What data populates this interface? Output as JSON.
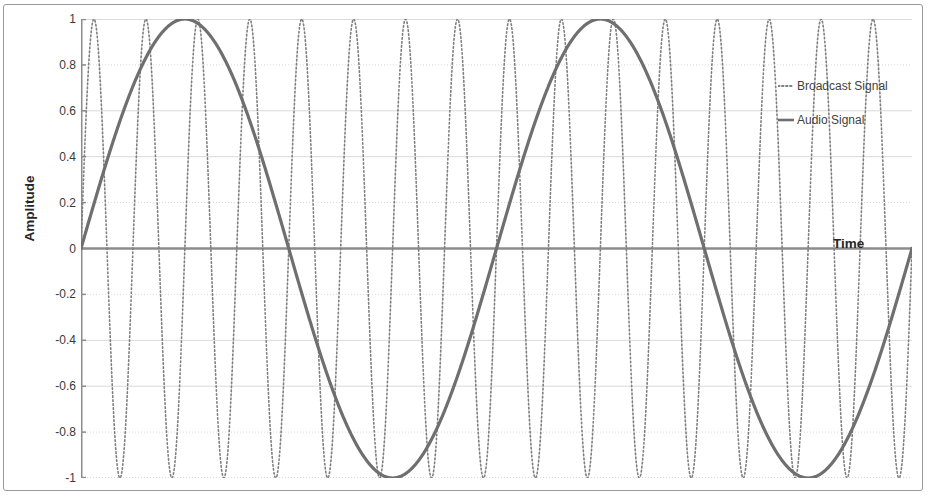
{
  "chart_data": {
    "type": "line",
    "title": "",
    "xlabel": "Time",
    "ylabel": "Amplitude",
    "ylim": [
      -1,
      1
    ],
    "xlim": [
      0,
      1
    ],
    "yticks": [
      "1",
      "0.8",
      "0.6",
      "0.4",
      "0.2",
      "0",
      "-0.2",
      "-0.4",
      "-0.6",
      "-0.8",
      "-1"
    ],
    "ytick_values": [
      1,
      0.8,
      0.6,
      0.4,
      0.2,
      0,
      -0.2,
      -0.4,
      -0.6,
      -0.8,
      -1
    ],
    "xticks": [],
    "grid": "horizontal",
    "legend_position": "upper-right-inside",
    "series": [
      {
        "name": "Broadcast Signal",
        "style": "dotted",
        "color": "#808080",
        "description": "High-frequency carrier sine wave at constant full amplitude, about 16 cycles across the plot",
        "cycles": 16,
        "amplitude": 1,
        "phase_deg": 0
      },
      {
        "name": "Audio Signal",
        "style": "solid",
        "color": "#6e6e6e",
        "description": "Low-frequency modulating sine wave, about 2 cycles across the plot",
        "cycles": 2,
        "amplitude": 1,
        "phase_deg": 0
      }
    ],
    "sampled_points": {
      "x_fraction": [
        0,
        0.05,
        0.1,
        0.15,
        0.2,
        0.25,
        0.3,
        0.35,
        0.4,
        0.45,
        0.5,
        0.55,
        0.6,
        0.65,
        0.7,
        0.75,
        0.8,
        0.85,
        0.9,
        0.95,
        1
      ],
      "audio_signal": [
        0,
        0.588,
        0.951,
        0.951,
        0.588,
        0,
        -0.588,
        -0.951,
        -0.951,
        -0.588,
        0,
        0.588,
        0.951,
        0.951,
        0.588,
        0,
        -0.588,
        -0.951,
        -0.951,
        -0.588,
        0
      ],
      "broadcast_signal": [
        0,
        1,
        0,
        -1,
        0,
        1,
        0,
        -1,
        0,
        1,
        0,
        -1,
        0,
        1,
        0,
        -1,
        0,
        1,
        0,
        -1,
        0
      ]
    }
  },
  "axes": {
    "y_title": "Amplitude",
    "x_title": "Time"
  },
  "legend": {
    "items": [
      {
        "label": "Broadcast Signal",
        "marker": "dotted-line-marker"
      },
      {
        "label": "Audio Signal",
        "marker": "solid-line-marker"
      }
    ]
  },
  "colors": {
    "gridline": "#d9d9d9",
    "axis": "#808080",
    "broadcast": "#7f7f7f",
    "audio": "#6f6f6f",
    "frame": "#9a9a9a",
    "text": "#3a3a3a"
  }
}
